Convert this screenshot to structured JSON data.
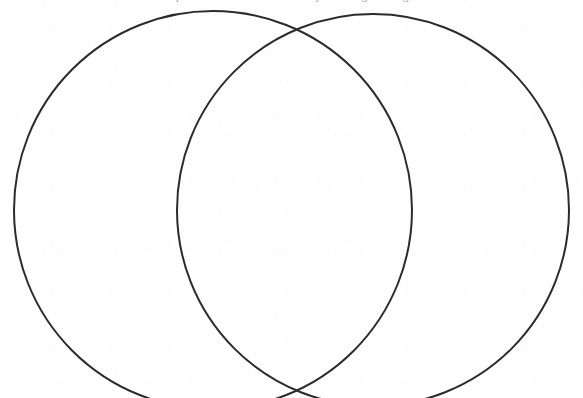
{
  "page": {
    "width": 583,
    "height": 398,
    "background_color": "#fefefe",
    "ink_color": "#2b2b2b"
  },
  "clipped_caption": {
    "text": "compare and contrast the two subjects using the diagram",
    "note": "Line of body text cropped by the top edge; only descender tips of letters are visible."
  },
  "diagram": {
    "type": "venn",
    "set_count": 2,
    "stroke_color": "#2b2b2b",
    "stroke_width": 2,
    "fill": "none",
    "labels_present": false,
    "left_circle": {
      "name": "left-set",
      "center_x": 213,
      "center_y": 210,
      "radius": 199,
      "label": ""
    },
    "right_circle": {
      "name": "right-set",
      "center_x": 373,
      "center_y": 210,
      "radius": 196,
      "label": ""
    },
    "regions": [
      {
        "id": "left-only",
        "label": "",
        "content": ""
      },
      {
        "id": "intersection",
        "label": "",
        "content": ""
      },
      {
        "id": "right-only",
        "label": "",
        "content": ""
      }
    ],
    "upper_intersection": {
      "x": 300,
      "y": 32
    },
    "lower_intersection": {
      "x": 300,
      "y": 402
    }
  }
}
